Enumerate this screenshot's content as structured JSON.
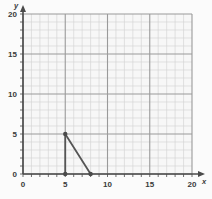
{
  "chart_data": {
    "type": "line",
    "title": "",
    "xlabel": "x",
    "ylabel": "y",
    "xlim": [
      0,
      20
    ],
    "ylim": [
      0,
      20
    ],
    "xticks": [
      0,
      5,
      10,
      15,
      20
    ],
    "yticks": [
      0,
      5,
      10,
      15,
      20
    ],
    "xtick_labels": [
      "0",
      "5",
      "10",
      "15",
      "20"
    ],
    "ytick_labels": [
      "0",
      "5",
      "10",
      "15",
      "20"
    ],
    "grid": true,
    "minor_grid_step": 1,
    "major_grid_step": 5,
    "legend": "none",
    "series": [
      {
        "name": "segment-vertical",
        "points": [
          [
            5,
            5
          ],
          [
            5,
            0
          ]
        ]
      },
      {
        "name": "segment-hypotenuse",
        "points": [
          [
            5,
            5
          ],
          [
            8,
            0
          ]
        ]
      }
    ],
    "markers": [
      {
        "label": "apex",
        "x": 5,
        "y": 5
      },
      {
        "label": "base-left",
        "x": 5,
        "y": 0
      },
      {
        "label": "base-right",
        "x": 8,
        "y": 0
      }
    ],
    "colors": {
      "background": "#fbfbfb",
      "plot_background": "#f7f7f7",
      "minor_grid": "#d6d6d6",
      "major_grid": "#9a9a9a",
      "axis": "#4a4a4a",
      "series": "#555555",
      "marker": "#4a4a4a",
      "tick_label": "#3a3a3a"
    }
  },
  "axes": {
    "y_axis_label": "y",
    "x_axis_label": "x"
  }
}
